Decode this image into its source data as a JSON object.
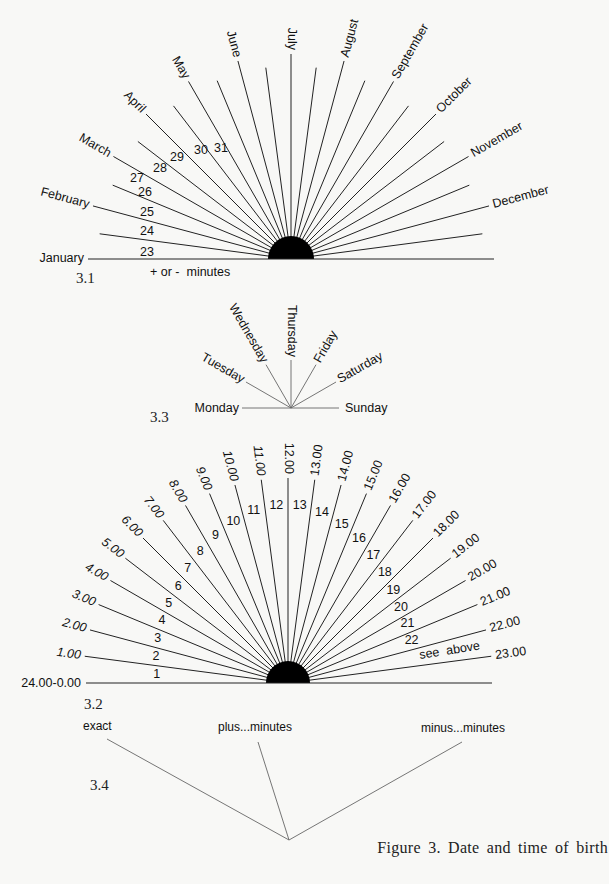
{
  "figure": {
    "caption": "Figure 3. Date and time of birth",
    "panels": {
      "p3_1": {
        "number": "3.1",
        "hub": {
          "cx": 291,
          "cy": 259,
          "r": 23
        },
        "ray_count": 24,
        "ray_step_deg": 7.5,
        "ray_length": 205,
        "baseline": {
          "x1": 88,
          "x2": 494
        },
        "months": [
          "January",
          "February",
          "March",
          "April",
          "May",
          "June",
          "July",
          "August",
          "September",
          "October",
          "November",
          "December"
        ],
        "days": [
          "23",
          "24",
          "25",
          "26",
          "27",
          "28",
          "29",
          "30",
          "31"
        ],
        "note": "+ or -  minutes"
      },
      "p3_3": {
        "number": "3.3",
        "center": {
          "x": 291,
          "y": 408
        },
        "days": [
          "Monday",
          "Tuesday",
          "Wednesday",
          "Thursday",
          "Friday",
          "Saturday",
          "Sunday"
        ]
      },
      "p3_2": {
        "number": "3.2",
        "hub": {
          "cx": 288,
          "cy": 683,
          "r": 22
        },
        "ray_count": 24,
        "ray_step_deg": 7.5,
        "ray_length": 205,
        "baseline": {
          "x1": 86,
          "x2": 492
        },
        "hours": [
          "24.00-0.00",
          "1.00",
          "2.00",
          "3.00",
          "4.00",
          "5.00",
          "6.00",
          "7.00",
          "8.00",
          "9.00",
          "10.00",
          "11.00",
          "12.00",
          "13.00",
          "14.00",
          "15.00",
          "16.00",
          "17.00",
          "18.00",
          "19.00",
          "20.00",
          "21.00",
          "22.00",
          "23.00"
        ],
        "sector_numbers": [
          "1",
          "2",
          "3",
          "4",
          "5",
          "6",
          "7",
          "8",
          "9",
          "10",
          "11",
          "12",
          "13",
          "14",
          "15",
          "16",
          "17",
          "18",
          "19",
          "20",
          "21",
          "22"
        ],
        "sector_note": "see  above"
      },
      "p3_4": {
        "number": "3.4",
        "apex": {
          "x": 289,
          "y": 840
        },
        "options": [
          "exact",
          "plus...minutes",
          "minus...minutes"
        ]
      }
    }
  }
}
